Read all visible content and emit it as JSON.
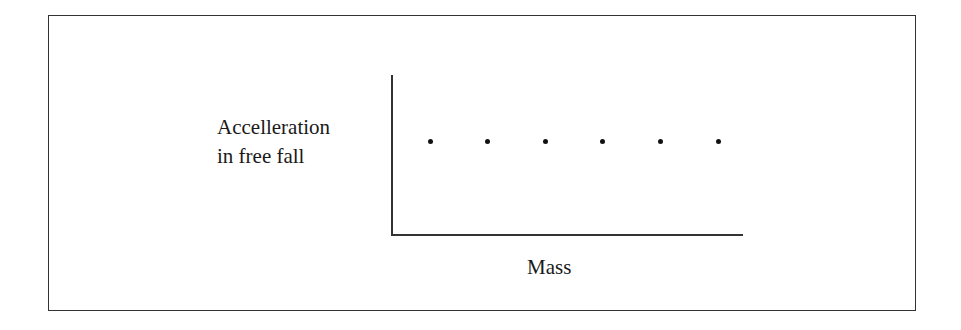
{
  "chart_data": {
    "type": "scatter",
    "title": "",
    "xlabel": "Mass",
    "ylabel": "Accelleration in free fall",
    "ylabel_lines": [
      "Accelleration",
      "in free fall"
    ],
    "x": [
      1,
      2,
      3,
      4,
      5,
      6
    ],
    "y": [
      1,
      1,
      1,
      1,
      1,
      1
    ],
    "ylim": [
      0,
      2
    ],
    "xlim": [
      0,
      7
    ],
    "grid": false,
    "ticks": false,
    "legend": null,
    "annotation": "Constant acceleration regardless of mass"
  }
}
